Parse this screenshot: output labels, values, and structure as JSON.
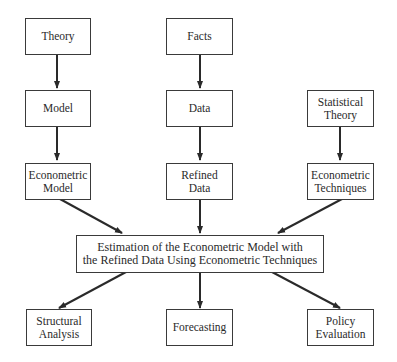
{
  "diagram": {
    "nodes": {
      "theory": {
        "lines": [
          "Theory"
        ]
      },
      "facts": {
        "lines": [
          "Facts"
        ]
      },
      "model": {
        "lines": [
          "Model"
        ]
      },
      "data": {
        "lines": [
          "Data"
        ]
      },
      "statistical_theory": {
        "lines": [
          "Statistical",
          "Theory"
        ]
      },
      "econometric_model": {
        "lines": [
          "Econometric",
          "Model"
        ]
      },
      "refined_data": {
        "lines": [
          "Refined",
          "Data"
        ]
      },
      "econometric_techniques": {
        "lines": [
          "Econometric",
          "Techniques"
        ]
      },
      "estimation": {
        "lines": [
          "Estimation of the Econometric Model with",
          "the Refined Data Using Econometric Techniques"
        ]
      },
      "structural_analysis": {
        "lines": [
          "Structural",
          "Analysis"
        ]
      },
      "forecasting": {
        "lines": [
          "Forecasting"
        ]
      },
      "policy_evaluation": {
        "lines": [
          "Policy",
          "Evaluation"
        ]
      }
    },
    "edges": [
      [
        "Theory",
        "Model"
      ],
      [
        "Model",
        "Econometric Model"
      ],
      [
        "Facts",
        "Data"
      ],
      [
        "Data",
        "Refined Data"
      ],
      [
        "Statistical Theory",
        "Econometric Techniques"
      ],
      [
        "Econometric Model",
        "Estimation"
      ],
      [
        "Refined Data",
        "Estimation"
      ],
      [
        "Econometric Techniques",
        "Estimation"
      ],
      [
        "Estimation",
        "Structural Analysis"
      ],
      [
        "Estimation",
        "Forecasting"
      ],
      [
        "Estimation",
        "Policy Evaluation"
      ]
    ],
    "colors": {
      "stroke": "#2a2a2a",
      "background": "#ffffff"
    }
  }
}
